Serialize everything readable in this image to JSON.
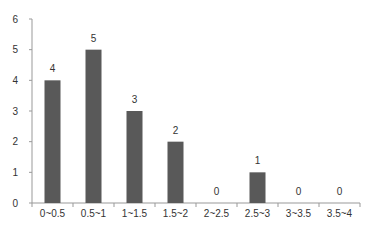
{
  "chart_data": {
    "type": "bar",
    "title": "",
    "xlabel": "",
    "ylabel": "",
    "categories": [
      "0~0.5",
      "0.5~1",
      "1~1.5",
      "1.5~2",
      "2~2.5",
      "2.5~3",
      "3~3.5",
      "3.5~4"
    ],
    "values": [
      4,
      5,
      3,
      2,
      0,
      1,
      0,
      0
    ],
    "ylim": [
      0,
      6
    ],
    "yticks": [
      0,
      1,
      2,
      3,
      4,
      5,
      6
    ],
    "grid": false,
    "legend": null,
    "data_labels": true,
    "bar_color": "#595959"
  }
}
